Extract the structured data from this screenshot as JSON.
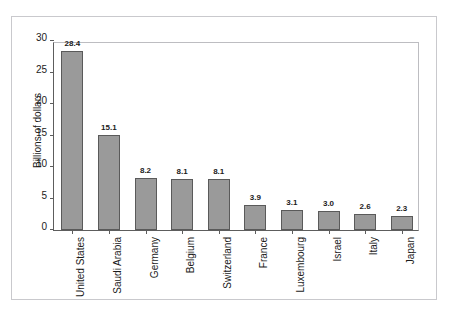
{
  "artifact": {
    "top_edge_text": ""
  },
  "chart_data": {
    "type": "bar",
    "title": "",
    "xlabel": "",
    "ylabel": "Billions of dollars",
    "ylim": [
      0,
      30
    ],
    "yticks": [
      0,
      5,
      10,
      15,
      20,
      25,
      30
    ],
    "ytick_labels": [
      "0",
      "5",
      "10",
      "15",
      "20",
      "25",
      "30"
    ],
    "grid": false,
    "legend": "none",
    "orientation": "vertical",
    "bar_color": "#9a9a9a",
    "bar_edge_color": "#5a5a5a",
    "axis_color": "#5d5d5d",
    "categories": [
      "United States",
      "Saudi Arabia",
      "Germany",
      "Belgium",
      "Switzerland",
      "France",
      "Luxembourg",
      "Israel",
      "Italy",
      "Japan"
    ],
    "values": [
      28.4,
      15.1,
      8.2,
      8.1,
      8.1,
      3.9,
      3.1,
      3.0,
      2.6,
      2.3
    ],
    "value_labels": [
      "28.4",
      "15.1",
      "8.2",
      "8.1",
      "8.1",
      "3.9",
      "3.1",
      "3.0",
      "2.6",
      "2.3"
    ]
  }
}
